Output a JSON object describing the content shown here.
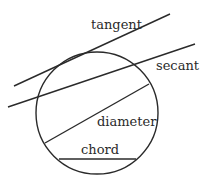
{
  "diagram": {
    "stroke_color": "#2a2a2a",
    "background": "#ffffff",
    "circle": {
      "cx": 97,
      "cy": 113,
      "r": 61
    },
    "labels": {
      "tangent": "tangent",
      "secant": "secant",
      "diameter": "diameter",
      "chord": "chord"
    },
    "lines": {
      "tangent": {
        "x1": 14,
        "y1": 86,
        "x2": 170,
        "y2": 14
      },
      "secant": {
        "x1": 8,
        "y1": 107,
        "x2": 195,
        "y2": 44
      },
      "diameter": {
        "x1": 45,
        "y1": 143,
        "x2": 149,
        "y2": 84
      },
      "chord": {
        "x1": 59,
        "y1": 159,
        "x2": 136,
        "y2": 159
      }
    }
  }
}
